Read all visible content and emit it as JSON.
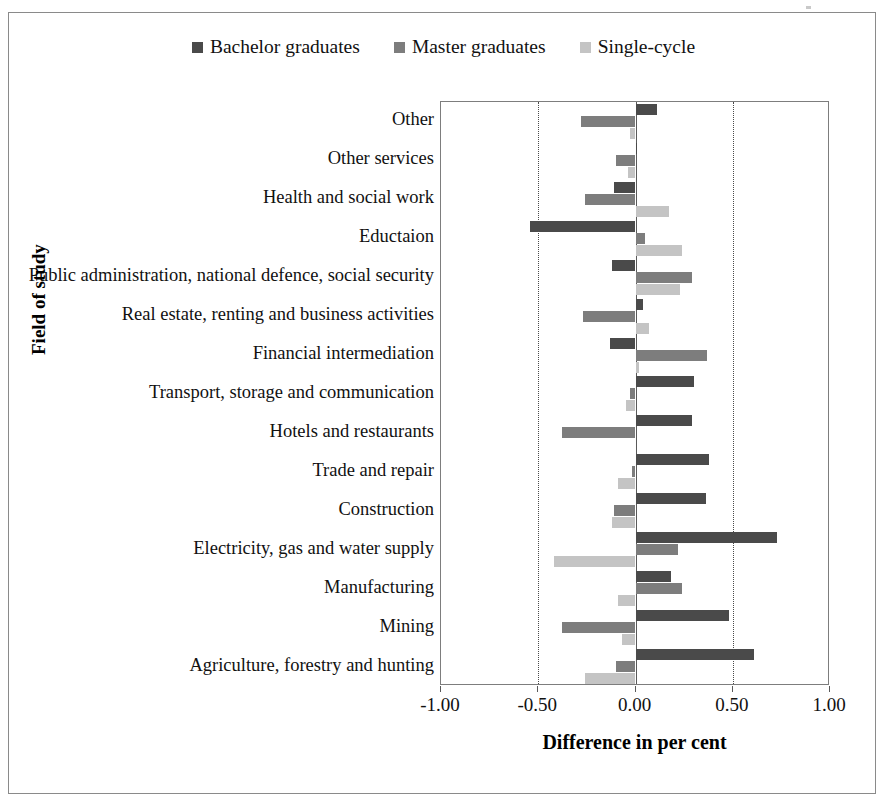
{
  "chart_data": {
    "type": "bar",
    "orientation": "horizontal",
    "title": "",
    "xlabel": "Difference in per cent",
    "ylabel": "Field of study",
    "xlim": [
      -1.0,
      1.0
    ],
    "xticks": [
      -1.0,
      -0.5,
      0.0,
      0.5,
      1.0
    ],
    "xtick_labels": [
      "-1.00",
      "-0.50",
      "0.00",
      "0.50",
      "1.00"
    ],
    "grid": "vertical dotted gridlines at -0.50 and 0.50",
    "legend_position": "top-center",
    "categories": [
      "Other",
      "Other services",
      "Health and social work",
      "Eductaion",
      "Public administration, national defence, social security",
      "Real estate, renting and business activities",
      "Financial intermediation",
      "Transport, storage and communication",
      "Hotels and restaurants",
      "Trade and repair",
      "Construction",
      "Electricity, gas and water supply",
      "Manufacturing",
      "Mining",
      "Agriculture, forestry and hunting"
    ],
    "series": [
      {
        "name": "Bachelor graduates",
        "color": "#4a4a4a",
        "values": [
          0.11,
          0.01,
          -0.11,
          -0.54,
          -0.12,
          0.04,
          -0.13,
          0.3,
          0.29,
          0.38,
          0.36,
          0.73,
          0.18,
          0.48,
          0.61
        ]
      },
      {
        "name": "Master graduates",
        "color": "#7d7d7d",
        "values": [
          -0.28,
          -0.1,
          -0.26,
          0.05,
          0.29,
          -0.27,
          0.37,
          -0.03,
          -0.38,
          -0.02,
          -0.11,
          0.22,
          0.24,
          -0.38,
          -0.1
        ]
      },
      {
        "name": "Single-cycle",
        "color": "#c4c4c4",
        "values": [
          -0.03,
          -0.04,
          0.17,
          0.24,
          0.23,
          0.07,
          0.02,
          -0.05,
          0.0,
          -0.09,
          -0.12,
          -0.42,
          -0.09,
          -0.07,
          -0.26
        ]
      }
    ]
  },
  "legend": {
    "items": [
      {
        "label": "Bachelor graduates",
        "color": "#4a4a4a"
      },
      {
        "label": "Master graduates",
        "color": "#7d7d7d"
      },
      {
        "label": "Single-cycle",
        "color": "#c4c4c4"
      }
    ]
  },
  "axes": {
    "x_title": "Difference in per cent",
    "y_title": "Field of study"
  }
}
